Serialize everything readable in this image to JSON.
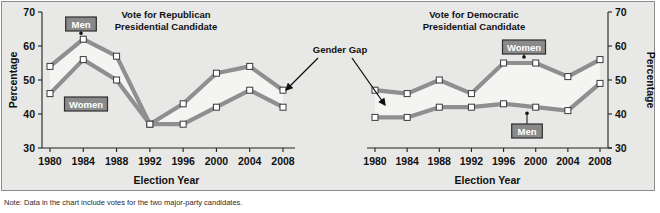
{
  "figure": {
    "background_color": "#e8e8e6",
    "border_color": "#8d8d8d",
    "note": "Note: Data in the chart include votes for the two major-party candidates."
  },
  "labels": {
    "men": "Men",
    "women": "Women",
    "gender_gap": "Gender Gap",
    "percentage_axis": "Percentage",
    "election_year_axis": "Election Year"
  },
  "colors": {
    "line": "#8f8f8f",
    "marker_fill": "#ffffff",
    "marker_stroke": "#3a3a3a",
    "fill_band": "#f4f4f2",
    "label_box_fill": "#8a8a8a",
    "label_box_border": "#2d2d2d",
    "text": "#111111"
  },
  "chart_data": [
    {
      "type": "line",
      "title": "Vote for Republican\nPresidential Candidate",
      "title_line1": "Vote for Republican",
      "title_line2": "Presidential Candidate",
      "xlabel": "Election Year",
      "ylabel": "Percentage",
      "ylim": [
        30,
        70
      ],
      "yticks": [
        30,
        40,
        50,
        60,
        70
      ],
      "grid": false,
      "legend_position": "inline-callout",
      "categories": [
        "1980",
        "1984",
        "1988",
        "1992",
        "1996",
        "2000",
        "2004",
        "2008"
      ],
      "series": [
        {
          "name": "Men",
          "values": [
            54,
            62,
            57,
            37,
            43,
            52,
            54,
            47
          ]
        },
        {
          "name": "Women",
          "values": [
            46,
            56,
            50,
            37,
            37,
            42,
            47,
            42
          ]
        }
      ],
      "annotations": [
        "Gender Gap"
      ]
    },
    {
      "type": "line",
      "title": "Vote for Democratic\nPresidential Candidate",
      "title_line1": "Vote for Democratic",
      "title_line2": "Presidential Candidate",
      "xlabel": "Election Year",
      "ylabel": "Percentage",
      "ylim": [
        30,
        70
      ],
      "yticks": [
        30,
        40,
        50,
        60,
        70
      ],
      "grid": false,
      "legend_position": "inline-callout",
      "categories": [
        "1980",
        "1984",
        "1988",
        "1992",
        "1996",
        "2000",
        "2004",
        "2008"
      ],
      "series": [
        {
          "name": "Women",
          "values": [
            47,
            46,
            50,
            46,
            55,
            55,
            51,
            56
          ]
        },
        {
          "name": "Men",
          "values": [
            39,
            39,
            42,
            42,
            43,
            42,
            41,
            49
          ]
        }
      ],
      "annotations": [
        "Gender Gap"
      ]
    }
  ]
}
